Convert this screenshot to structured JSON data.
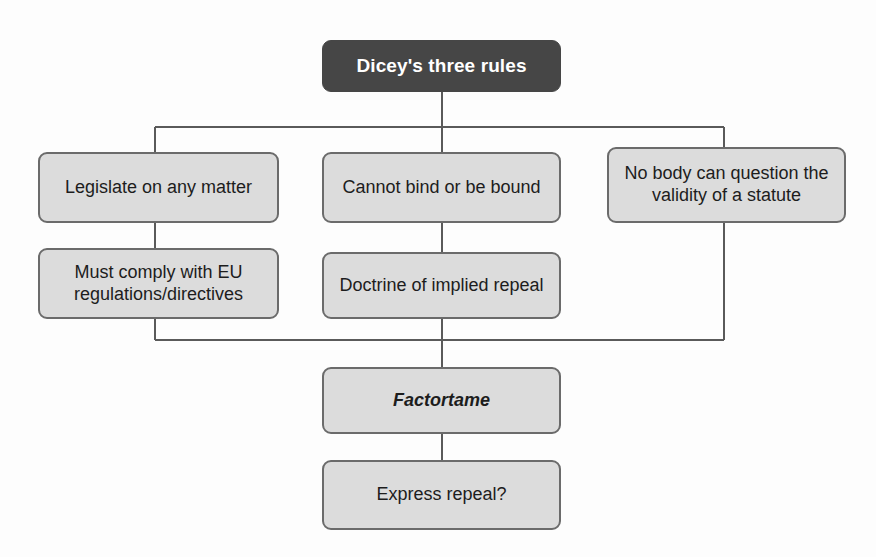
{
  "diagram": {
    "type": "flowchart",
    "title": "Dicey's three rules",
    "background_color": "#fdfdfd",
    "root": {
      "id": "root",
      "label": "Dicey's three rules",
      "fill": "#464646",
      "text_color": "#ffffff",
      "x": 322,
      "y": 40,
      "w": 239,
      "h": 52
    },
    "nodes": [
      {
        "id": "legislate",
        "label": "Legislate on any matter",
        "fill": "#dcdcdc",
        "text_color": "#1d1d1d",
        "italic": false,
        "x": 38,
        "y": 152,
        "w": 241,
        "h": 71
      },
      {
        "id": "cannot-bind",
        "label": "Cannot bind or be bound",
        "fill": "#dcdcdc",
        "text_color": "#1d1d1d",
        "italic": false,
        "x": 322,
        "y": 152,
        "w": 239,
        "h": 71
      },
      {
        "id": "no-body-question",
        "label": "No body can question the\nvalidity of a statute",
        "fill": "#dcdcdc",
        "text_color": "#1d1d1d",
        "italic": false,
        "x": 607,
        "y": 147,
        "w": 239,
        "h": 76
      },
      {
        "id": "eu-regulations",
        "label": "Must comply with EU\nregulations/directives",
        "fill": "#dcdcdc",
        "text_color": "#1d1d1d",
        "italic": false,
        "x": 38,
        "y": 248,
        "w": 241,
        "h": 71
      },
      {
        "id": "implied-repeal",
        "label": "Doctrine of implied repeal",
        "fill": "#dcdcdc",
        "text_color": "#1d1d1d",
        "italic": false,
        "x": 322,
        "y": 252,
        "w": 239,
        "h": 67
      },
      {
        "id": "factortame",
        "label": "Factortame",
        "fill": "#dcdcdc",
        "text_color": "#1d1d1d",
        "italic": true,
        "x": 322,
        "y": 367,
        "w": 239,
        "h": 67
      },
      {
        "id": "express-repeal",
        "label": "Express repeal?",
        "fill": "#dcdcdc",
        "text_color": "#1d1d1d",
        "italic": false,
        "x": 322,
        "y": 460,
        "w": 239,
        "h": 70
      }
    ],
    "connector_color": "#5a5a5a",
    "connectors": [
      {
        "id": "root-to-split",
        "from": "root",
        "to": "split-bar"
      },
      {
        "id": "split-bar",
        "from": "split-bar-left",
        "to": "split-bar-right"
      },
      {
        "id": "split-to-legislate",
        "from": "split-bar",
        "to": "legislate"
      },
      {
        "id": "split-to-cannot-bind",
        "from": "split-bar",
        "to": "cannot-bind"
      },
      {
        "id": "split-to-no-body",
        "from": "split-bar",
        "to": "no-body-question"
      },
      {
        "id": "legislate-to-eu",
        "from": "legislate",
        "to": "eu-regulations"
      },
      {
        "id": "cannot-bind-to-implied",
        "from": "cannot-bind",
        "to": "implied-repeal"
      },
      {
        "id": "eu-to-merge",
        "from": "eu-regulations",
        "to": "merge-bar"
      },
      {
        "id": "implied-to-merge",
        "from": "implied-repeal",
        "to": "merge-bar"
      },
      {
        "id": "no-body-to-merge",
        "from": "no-body-question",
        "to": "merge-bar"
      },
      {
        "id": "merge-to-factortame",
        "from": "merge-bar",
        "to": "factortame"
      },
      {
        "id": "factortame-to-express",
        "from": "factortame",
        "to": "express-repeal"
      }
    ]
  }
}
